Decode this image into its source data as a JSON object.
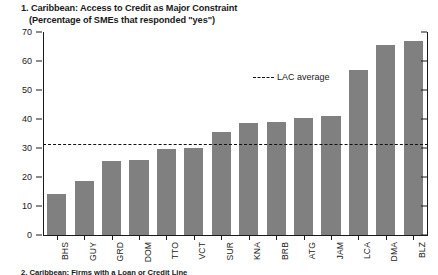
{
  "figure": {
    "title_line1": "1. Caribbean: Access to Credit as Major Constraint",
    "title_line2": "(Percentage of SMEs that responded \"yes\")",
    "footer_note": "2. Caribbean: Firms with a Loan or Credit Line"
  },
  "legend": {
    "average_label": "LAC average"
  },
  "colors": {
    "bar": "#808080",
    "axis": "#1a1a1a",
    "average_line": "#111111",
    "background": "#ffffff"
  },
  "chart_data": {
    "type": "bar",
    "title": "1. Caribbean: Access to Credit as Major Constraint",
    "subtitle": "(Percentage of SMEs that responded \"yes\")",
    "xlabel": "",
    "ylabel": "",
    "ylim": [
      0,
      70
    ],
    "yticks": [
      0,
      10,
      20,
      30,
      40,
      50,
      60,
      70
    ],
    "grid": false,
    "legend_position": "inside-upper-right",
    "categories": [
      "BHS",
      "GUY",
      "GRD",
      "DOM",
      "TTO",
      "VCT",
      "SUR",
      "KNA",
      "BRB",
      "ATG",
      "JAM",
      "LCA",
      "DMA",
      "BLZ"
    ],
    "values": [
      14.0,
      18.5,
      25.5,
      26.0,
      29.5,
      30.0,
      35.5,
      38.5,
      39.0,
      40.5,
      41.0,
      57.0,
      65.5,
      67.0
    ],
    "series": [
      {
        "name": "Percentage of SMEs that responded \"yes\"",
        "values": [
          14.0,
          18.5,
          25.5,
          26.0,
          29.5,
          30.0,
          35.5,
          38.5,
          39.0,
          40.5,
          41.0,
          57.0,
          65.5,
          67.0
        ]
      }
    ],
    "reference_lines": [
      {
        "name": "LAC average",
        "value": 31.5,
        "style": "dashed",
        "orientation": "horizontal"
      }
    ]
  }
}
